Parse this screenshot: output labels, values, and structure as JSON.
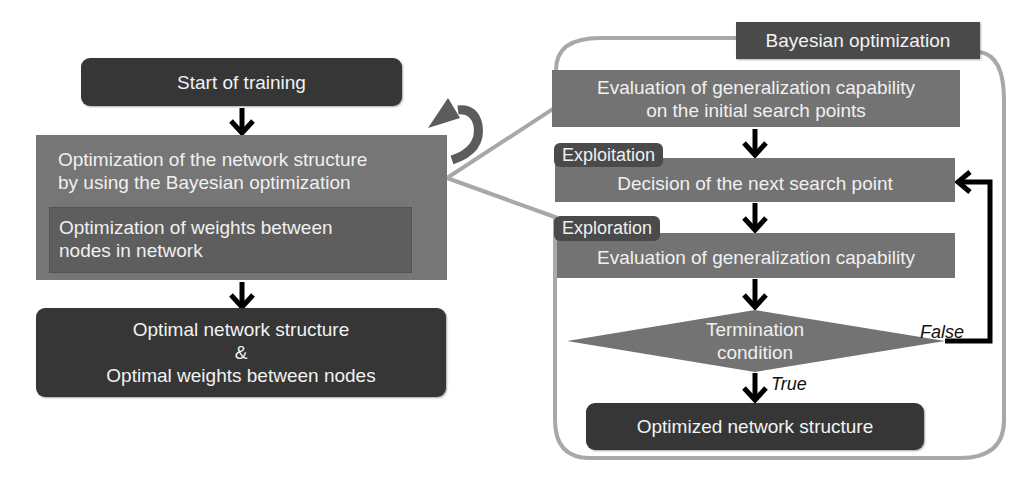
{
  "left_flow": {
    "start": "Start of training",
    "outer_process": {
      "line1": "Optimization of the network structure",
      "line2": "by using the Bayesian optimization"
    },
    "inner_process": {
      "line1": "Optimization of weights between",
      "line2": "nodes in network"
    },
    "result": {
      "line1": "Optimal network structure",
      "line2": "&",
      "line3": "Optimal weights between nodes"
    }
  },
  "right_flow": {
    "title": "Bayesian optimization",
    "initial_eval": {
      "line1": "Evaluation of generalization capability",
      "line2": "on the initial search points"
    },
    "exploitation_tag": "Exploitation",
    "decision": "Decision of the next search point",
    "exploration_tag": "Exploration",
    "evaluation": "Evaluation of generalization capability",
    "termination": {
      "line1": "Termination",
      "line2": "condition"
    },
    "false_label": "False",
    "true_label": "True",
    "output": "Optimized network structure"
  },
  "colors": {
    "dark": "#363636",
    "mid": "#737373",
    "inner": "#5a5a5a",
    "outline": "#a8a8a8",
    "arrow": "#000000"
  }
}
